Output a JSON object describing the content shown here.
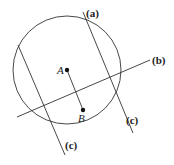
{
  "circle": {
    "cx": 67,
    "cy": 70,
    "r": 54
  },
  "points": [
    {
      "name": "A",
      "x": 67,
      "y": 70,
      "lx": 57,
      "ly": 74
    },
    {
      "name": "B",
      "x": 83,
      "y": 110,
      "lx": 78,
      "ly": 122
    }
  ],
  "lines": [
    {
      "id": "a",
      "x1": 83,
      "y1": 12,
      "x2": 133,
      "y2": 133
    },
    {
      "id": "b",
      "x1": 17,
      "y1": 117,
      "x2": 150,
      "y2": 60
    },
    {
      "id": "c-left",
      "x1": 18,
      "y1": 45,
      "x2": 65,
      "y2": 155
    },
    {
      "id": "c-right",
      "x1": 83,
      "y1": 12,
      "x2": 133,
      "y2": 133
    }
  ],
  "labels": {
    "a": {
      "text": "(a)",
      "x": 86,
      "y": 17
    },
    "b": {
      "text": "(b)",
      "x": 152,
      "y": 64
    },
    "c_left": {
      "text": "(c)",
      "x": 65,
      "y": 149
    },
    "c_right": {
      "text": "(c)",
      "x": 126,
      "y": 124
    }
  }
}
